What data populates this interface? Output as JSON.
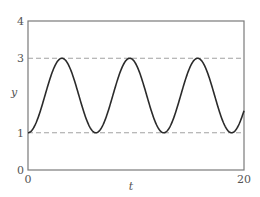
{
  "chart_data": {
    "type": "line",
    "title": "",
    "xlabel": "t",
    "ylabel": "y",
    "xlim": [
      0,
      20
    ],
    "ylim": [
      0,
      4
    ],
    "x_ticks": [
      "0",
      "20"
    ],
    "y_ticks": [
      "0",
      "1",
      "3",
      "4"
    ],
    "grid": false,
    "reference_lines": [
      {
        "y": 3,
        "style": "dashed"
      },
      {
        "y": 1,
        "style": "dashed"
      }
    ],
    "series": [
      {
        "name": "y(t)",
        "description": "periodic oscillation between 1 and 3, period ≈ 2π (y ≈ 2 − cos t)",
        "x": [
          0,
          1.57,
          3.14,
          4.71,
          6.28,
          7.85,
          9.42,
          11.0,
          12.57,
          14.14,
          15.71,
          17.28,
          18.85,
          20
        ],
        "values": [
          1,
          2,
          3,
          2,
          1,
          2,
          3,
          2,
          1,
          2,
          3,
          2,
          1,
          1.59
        ]
      }
    ],
    "legend": null
  },
  "colors": {
    "axis": "#7a7a7a",
    "curve": "#2b2b2b",
    "dashed": "#8a8a8a"
  },
  "layout": {
    "plot_left": 28,
    "plot_right": 244,
    "plot_top": 21,
    "plot_bottom": 170
  }
}
